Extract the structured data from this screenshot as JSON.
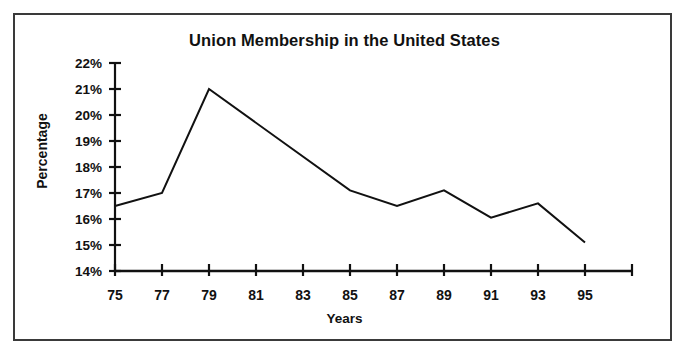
{
  "figure": {
    "title": "Union Membership in the United States",
    "background_color": "#ffffff",
    "border_color": "#3a3a3a",
    "ink_color": "#111111"
  },
  "axes": {
    "y_title": "Percentage",
    "x_title": "Years",
    "y_tick_labels": [
      "22%",
      "21%",
      "20%",
      "19%",
      "18%",
      "17%",
      "16%",
      "15%",
      "14%"
    ],
    "x_tick_labels": [
      "75",
      "77",
      "79",
      "81",
      "83",
      "85",
      "87",
      "89",
      "91",
      "93",
      "95"
    ]
  },
  "chart_data": {
    "type": "line",
    "title": "Union Membership in the United States",
    "subtitle": "",
    "xlabel": "Years",
    "ylabel": "Percentage",
    "x": [
      75,
      76,
      77,
      78,
      79,
      80,
      81,
      82,
      83,
      84,
      85,
      86,
      87,
      88,
      89,
      90,
      91,
      92,
      93,
      94,
      95
    ],
    "values": [
      16.5,
      16.75,
      17.0,
      19.0,
      21.0,
      20.35,
      19.7,
      19.05,
      18.4,
      17.75,
      17.1,
      16.8,
      16.5,
      16.8,
      17.1,
      16.58,
      16.05,
      16.33,
      16.6,
      15.85,
      15.1
    ],
    "series": [
      {
        "name": "Union membership rate",
        "values": [
          16.5,
          16.75,
          17.0,
          19.0,
          21.0,
          20.35,
          19.7,
          19.05,
          18.4,
          17.75,
          17.1,
          16.8,
          16.5,
          16.8,
          17.1,
          16.58,
          16.05,
          16.33,
          16.6,
          15.85,
          15.1
        ]
      }
    ],
    "vertices": [
      {
        "x": 75,
        "y": 16.5
      },
      {
        "x": 77,
        "y": 17.0
      },
      {
        "x": 79,
        "y": 21.0
      },
      {
        "x": 85,
        "y": 17.1
      },
      {
        "x": 87,
        "y": 16.5
      },
      {
        "x": 89,
        "y": 17.1
      },
      {
        "x": 91,
        "y": 16.05
      },
      {
        "x": 93,
        "y": 16.6
      },
      {
        "x": 95,
        "y": 15.1
      }
    ],
    "xlim": [
      75,
      97
    ],
    "ylim": [
      14,
      22
    ],
    "y_tick_values": [
      14,
      15,
      16,
      17,
      18,
      19,
      20,
      21,
      22
    ],
    "x_tick_values": [
      75,
      77,
      79,
      81,
      83,
      85,
      87,
      89,
      91,
      93,
      95,
      97
    ],
    "x_labeled_tick_values": [
      75,
      77,
      79,
      81,
      83,
      85,
      87,
      89,
      91,
      93,
      95
    ],
    "grid": false,
    "legend": "none",
    "line_color": "#111111",
    "marker": "none"
  }
}
